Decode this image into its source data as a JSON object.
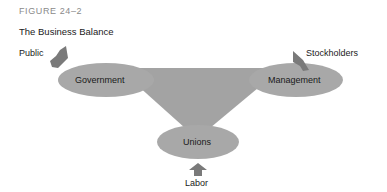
{
  "figure": {
    "label": "FIGURE 24–2",
    "title": "The Business Balance"
  },
  "nodes": {
    "government": "Government",
    "management": "Management",
    "unions": "Unions"
  },
  "inputs": {
    "public": "Public",
    "stockholders": "Stockholders",
    "labor": "Labor"
  },
  "colors": {
    "ellipse_fill": "#a8a8a8",
    "triangle_fill": "#a3a3a3",
    "arrow_fill": "#7a7a7a",
    "text": "#1a1a1a",
    "figure_label": "#8a8a8a"
  }
}
